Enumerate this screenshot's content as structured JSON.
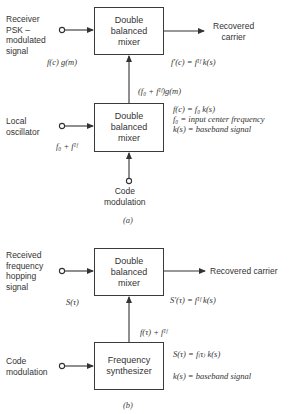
{
  "diagram_a": {
    "caption": "(a)",
    "inputs": {
      "receiver": [
        "Receiver",
        "PSK –",
        "modulated",
        "signal"
      ],
      "local_oscillator": [
        "Local",
        "oscillator"
      ],
      "code_modulation": [
        "Code",
        "modulation"
      ]
    },
    "blocks": {
      "mixer_top": [
        "Double",
        "balanced",
        "mixer"
      ],
      "mixer_bottom": [
        "Double",
        "balanced",
        "mixer"
      ]
    },
    "output": [
      "Recovered",
      "carrier"
    ],
    "signals": {
      "receiver_signal": "f(c) g(m)",
      "lo_signal": "f₀ + fᴵᶠ",
      "mixer_link": "(f₀ + fᴵᶠ)g(m)",
      "output_signal": "f′(c) = fᴵᶠ k(s)"
    },
    "legend": [
      "f(c) = f₀ k(s)",
      "f₀ = input center frequency",
      "k(s) = baseband signal"
    ]
  },
  "diagram_b": {
    "caption": "(b)",
    "inputs": {
      "received": [
        "Received",
        "frequency",
        "hopping",
        "signal"
      ],
      "code_modulation": [
        "Code",
        "modulation"
      ]
    },
    "blocks": {
      "mixer": [
        "Double",
        "balanced",
        "mixer"
      ],
      "synthesizer": [
        "Frequency",
        "synthesizer"
      ]
    },
    "output": "Recovered carrier",
    "signals": {
      "received_signal": "S(τ)",
      "synth_link": "f(τ) + fᴵᶠ",
      "output_signal": "S′(τ) = fᴵᶠ k(s)"
    },
    "legend": [
      "S(τ) = f₍τ₎ k(s)",
      "k(s) = baseband signal"
    ]
  }
}
